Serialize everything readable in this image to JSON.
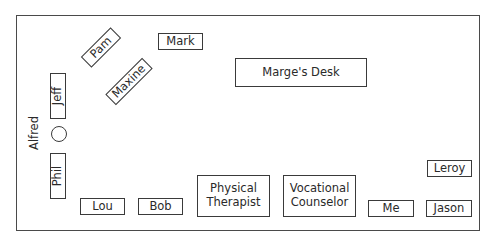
{
  "diagram": {
    "type": "office-floor-plan",
    "room": {
      "label": ""
    },
    "desks": [
      {
        "id": "mark",
        "label": "Mark"
      },
      {
        "id": "pam",
        "label": "Pam"
      },
      {
        "id": "maxine",
        "label": "Maxine"
      },
      {
        "id": "marges-desk",
        "label": "Marge's Desk"
      },
      {
        "id": "jeff",
        "label": "Jeff"
      },
      {
        "id": "phil",
        "label": "Phil"
      },
      {
        "id": "lou",
        "label": "Lou"
      },
      {
        "id": "bob",
        "label": "Bob"
      },
      {
        "id": "physical-therapist",
        "label_lines": [
          "Physical",
          "Therapist"
        ]
      },
      {
        "id": "vocational-counselor",
        "label_lines": [
          "Vocational",
          "Counselor"
        ]
      },
      {
        "id": "me",
        "label": "Me"
      },
      {
        "id": "jason",
        "label": "Jason"
      },
      {
        "id": "leroy",
        "label": "Leroy"
      }
    ],
    "people": [
      {
        "id": "alfred",
        "label": "Alfred",
        "marker": "circle"
      }
    ]
  }
}
